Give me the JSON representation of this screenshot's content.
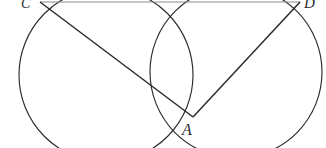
{
  "figure": {
    "canvas": {
      "width": 326,
      "height": 148,
      "background": "#ffffff"
    },
    "stroke_color": "#2b2b2b",
    "faint_stroke_color": "#8c8c8c",
    "labels": [
      {
        "id": "label-C",
        "text": "C",
        "x": 21,
        "y": -3
      },
      {
        "id": "label-D",
        "text": "D",
        "x": 304,
        "y": -4
      },
      {
        "id": "label-A",
        "text": "A",
        "x": 182,
        "y": 122
      }
    ],
    "points": {
      "A": {
        "x": 193,
        "y": 117
      },
      "C": {
        "x": 40,
        "y": 2
      },
      "D": {
        "x": 300,
        "y": 2
      },
      "top_intersection": {
        "x": 192,
        "y": 0
      }
    },
    "circles": [
      {
        "name": "left-circle",
        "cx": 106,
        "cy": 75,
        "r": 87
      },
      {
        "name": "right-circle",
        "cx": 236,
        "cy": 72,
        "r": 86
      }
    ],
    "segments": [
      {
        "name": "chord-CA",
        "x1": 40,
        "y1": 2,
        "x2": 193,
        "y2": 117
      },
      {
        "name": "chord-DA",
        "x1": 300,
        "y1": 2,
        "x2": 193,
        "y2": 117
      },
      {
        "name": "line-CD",
        "x1": 40,
        "y1": 2,
        "x2": 300,
        "y2": 2,
        "faint": true
      }
    ]
  }
}
